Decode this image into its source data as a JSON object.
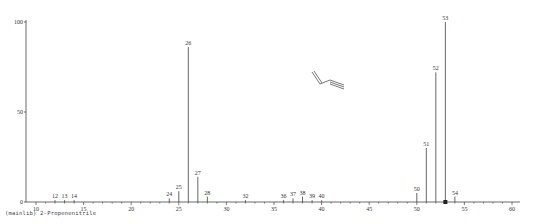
{
  "chart_data": {
    "type": "bar",
    "title": "",
    "compound_caption": "(mainlib) 2-Propenenitrile",
    "xlabel": "m/z",
    "ylabel": "Relative Abundance",
    "xlim": [
      9,
      61
    ],
    "ylim": [
      0,
      100
    ],
    "x_ticks": [
      10,
      15,
      20,
      25,
      30,
      35,
      40,
      45,
      50,
      55,
      60
    ],
    "y_ticks": [
      0,
      50,
      100
    ],
    "grid": false,
    "legend": null,
    "series": [
      {
        "name": "2-Propenenitrile",
        "x": [
          12,
          13,
          14,
          24,
          25,
          26,
          27,
          28,
          32,
          36,
          37,
          38,
          39,
          40,
          50,
          51,
          52,
          53,
          54
        ],
        "values": [
          1,
          1,
          1,
          2,
          6,
          86,
          14,
          3,
          1,
          1,
          2,
          3,
          1,
          1,
          5,
          30,
          72,
          100,
          3
        ]
      }
    ],
    "annotations": [
      "molecular-ion-marker at m/z 53",
      "structure: CH2=CH-C≡N"
    ]
  }
}
